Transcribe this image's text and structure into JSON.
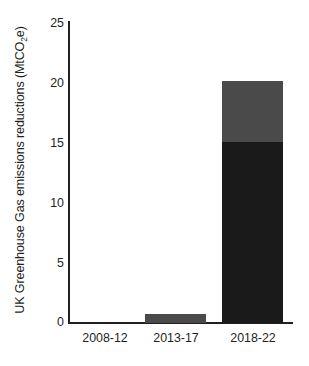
{
  "chart_data": {
    "type": "bar",
    "stacked": true,
    "title": "",
    "xlabel": "",
    "ylabel": "UK Greenhouse Gas emissions reductions (MtCO",
    "ylabel_sub": "2",
    "ylabel_tail": "e)",
    "ylabel_full": "UK Greenhouse Gas emissions reductions (MtCO2e)",
    "categories": [
      "2008-12",
      "2013-17",
      "2018-22"
    ],
    "ylim": [
      0,
      25
    ],
    "yticks": [
      0,
      5,
      10,
      15,
      20,
      25
    ],
    "ytick_labels": [
      "0",
      "5",
      "10",
      "15",
      "20",
      "25"
    ],
    "grid": false,
    "legend": "none",
    "series": [
      {
        "name": "lower-segment",
        "color": "#1a1a1a",
        "values": [
          0,
          0,
          15.0
        ]
      },
      {
        "name": "upper-segment",
        "color": "#4a4a4a",
        "values": [
          0,
          0.75,
          5.1
        ]
      }
    ],
    "totals": [
      0,
      0.75,
      20.1
    ]
  },
  "axis": {
    "y_title_text": "UK Greenhouse Gas emissions reductions (MtCO",
    "y_title_sub": "2",
    "y_title_end": "e)"
  }
}
